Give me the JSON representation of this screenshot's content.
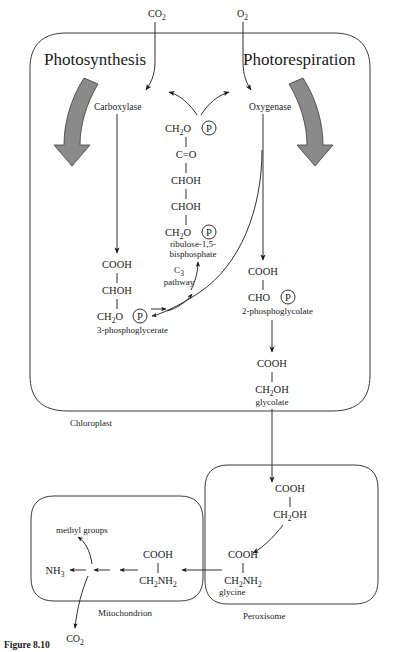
{
  "figure": {
    "caption": "Figure 8.10",
    "title_left": "Photosynthesis",
    "title_right": "Photorespiration"
  },
  "gases": {
    "co2_top": "CO",
    "co2_top_sub": "2",
    "o2_top": "O",
    "o2_top_sub": "2",
    "co2_bottom": "CO",
    "co2_bottom_sub": "2"
  },
  "organelles": [
    {
      "name": "Chloroplast",
      "label": "Chloroplast"
    },
    {
      "name": "Peroxisome",
      "label": "Peroxisome"
    },
    {
      "name": "Mitochondrion",
      "label": "Mitochondrion"
    }
  ],
  "enzymes": [
    {
      "name": "carboxylase",
      "label": "Carboxylase"
    },
    {
      "name": "oxygenase",
      "label": "Oxygenase"
    }
  ],
  "pathway": {
    "c3_line1": "C",
    "c3_line1_sub": "3",
    "c3_line2": "pathway"
  },
  "metabolites": {
    "rubp": {
      "name": "ribulose-1,5-bisphosphate",
      "line1_a": "CH",
      "line1_sub": "2",
      "line1_b": "O",
      "line1_p": "P",
      "line2": "C",
      "line2_b": "O",
      "line3": "CHOH",
      "line4": "CHOH",
      "line5_a": "CH",
      "line5_sub": "2",
      "line5_b": "O",
      "line5_p": "P",
      "name_line1": "ribulose-1,5-",
      "name_line2": "bisphosphate"
    },
    "pga": {
      "name": "3-phosphoglycerate",
      "line1": "COOH",
      "line2": "CHOH",
      "line3_a": "CH",
      "line3_sub": "2",
      "line3_b": "O",
      "line3_p": "P",
      "label": "3-phosphoglycerate"
    },
    "phosphoglycolate": {
      "name": "2-phosphoglycolate",
      "line1": "COOH",
      "line2_a": "CHO",
      "line2_p": "P",
      "label": "2-phosphoglycolate"
    },
    "glycolate": {
      "name": "glycolate",
      "line1": "COOH",
      "line2_a": "CH",
      "line2_sub": "2",
      "line2_b": "OH",
      "label": "glycolate"
    },
    "glycolate_perox": {
      "name": "glycolate-in-peroxisome",
      "line1": "COOH",
      "line2_a": "CH",
      "line2_sub": "2",
      "line2_b": "OH"
    },
    "glycine": {
      "name": "glycine",
      "line1": "COOH",
      "line2_a": "CH",
      "line2_sub": "2",
      "line2_b": "NH",
      "line2_sub2": "2",
      "label": "glycine"
    },
    "glycine_mito": {
      "name": "glycine-in-mitochondrion",
      "line1": "COOH",
      "line2_a": "CH",
      "line2_sub": "2",
      "line2_b": "NH",
      "line2_sub2": "2"
    }
  },
  "products": {
    "methyl_groups": "methyl groups",
    "ammonia": "NH",
    "ammonia_sub": "3"
  },
  "colors": {
    "ink": "#1a1a1a",
    "membrane": "#3a3a3a",
    "fat_arrow_fill": "#8a8a8a",
    "background": "#ffffff"
  }
}
